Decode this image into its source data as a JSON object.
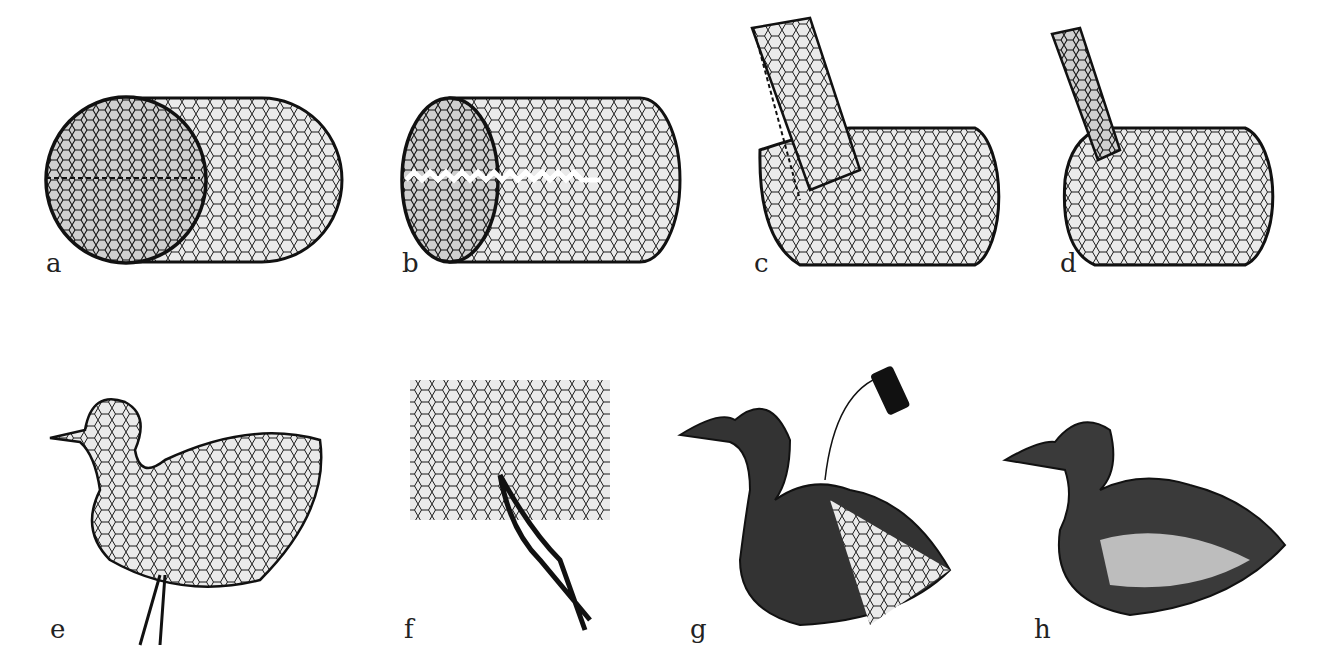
{
  "figure": {
    "panels": [
      {
        "id": "a",
        "label": "a",
        "caption": "wire-mesh cylinder with end circle, seam stitched"
      },
      {
        "id": "b",
        "label": "b",
        "caption": "wire-mesh cylinder, seam opened with zigzag cut"
      },
      {
        "id": "c",
        "label": "c",
        "caption": "mesh rolled into body with neck tube being rolled"
      },
      {
        "id": "d",
        "label": "d",
        "caption": "body with neck tube attached"
      },
      {
        "id": "e",
        "label": "e",
        "caption": "shaped mesh duck form with pliers"
      },
      {
        "id": "f",
        "label": "f",
        "caption": "close-up of hexagonal mesh cut with pliers"
      },
      {
        "id": "g",
        "label": "g",
        "caption": "duck partially covered, thread and spool"
      },
      {
        "id": "h",
        "label": "h",
        "caption": "finished feathered duck"
      }
    ]
  },
  "colors": {
    "ink": "#1a1a1a",
    "paper": "#ffffff",
    "mesh_fill": "#dcdcdc"
  }
}
